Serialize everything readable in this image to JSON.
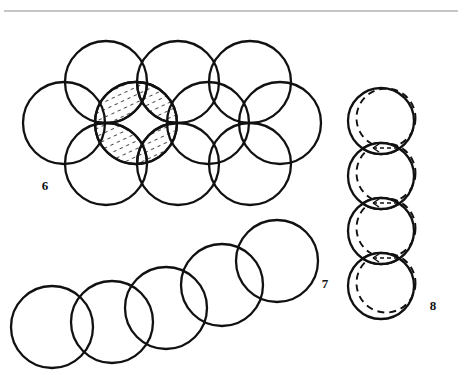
{
  "page": {
    "width": 462,
    "height": 385,
    "background": "#ffffff",
    "stroke_color": "#111111",
    "rule_color": "#8e8e8e",
    "hatch_color": "#4a4a4a"
  },
  "top_rule": {
    "name": "horizontal-rule",
    "x1": 4,
    "x2": 458,
    "y": 11,
    "thickness": 1
  },
  "figures": [
    {
      "id": "figure-6",
      "label": "6",
      "label_x": 45,
      "label_y": 190,
      "caption_position": "bottom-left",
      "description": "Hexagonal-packed cluster of nine equal circles in two offset rows; four lens-shaped intersection areas near the centre are hatched with short dashes",
      "circle_radius": 41,
      "circle_count": 9,
      "lens_count": 4,
      "circles": [
        {
          "cx": 106,
          "cy": 82
        },
        {
          "cx": 178,
          "cy": 82
        },
        {
          "cx": 250,
          "cy": 82
        },
        {
          "cx": 64,
          "cy": 123
        },
        {
          "cx": 136,
          "cy": 123
        },
        {
          "cx": 208,
          "cy": 123
        },
        {
          "cx": 280,
          "cy": 123
        },
        {
          "cx": 106,
          "cy": 164
        },
        {
          "cx": 178,
          "cy": 164
        },
        {
          "cx": 250,
          "cy": 164
        }
      ],
      "lenses": [
        {
          "a": 0,
          "b": 4,
          "note": "upper-left lens"
        },
        {
          "a": 1,
          "b": 4,
          "note": "upper-right lens"
        },
        {
          "a": 7,
          "b": 4,
          "note": "lower-left lens"
        },
        {
          "a": 8,
          "b": 4,
          "note": "lower-right lens"
        }
      ]
    },
    {
      "id": "figure-7",
      "label": "7",
      "label_x": 325,
      "label_y": 288,
      "caption_position": "right",
      "description": "Chain of five equal overlapping circles rising diagonally from lower-left to upper-right",
      "circle_radius": 41,
      "circle_count": 5,
      "circles": [
        {
          "cx": 52,
          "cy": 327
        },
        {
          "cx": 112,
          "cy": 322
        },
        {
          "cx": 166,
          "cy": 308
        },
        {
          "cx": 222,
          "cy": 285
        },
        {
          "cx": 277,
          "cy": 261
        }
      ]
    },
    {
      "id": "figure-8",
      "label": "8",
      "label_x": 433,
      "label_y": 310,
      "caption_position": "bottom-right",
      "description": "Vertical column of four circle pairs; each pair is a solid circle plus a dashed circle offset slightly, the narrow overlap lenses between successive pairs contain small double-headed arrows",
      "circle_radius": 33,
      "unit_count": 4,
      "dash_offset": {
        "dx": 5,
        "dy": -3
      },
      "units": [
        {
          "cx": 381,
          "cy": 121,
          "arrow_below": true
        },
        {
          "cx": 381,
          "cy": 176,
          "arrow_below": true
        },
        {
          "cx": 381,
          "cy": 231,
          "arrow_below": true
        },
        {
          "cx": 381,
          "cy": 286,
          "arrow_below": false
        }
      ],
      "arrows": [
        {
          "cx": 386,
          "cy": 148,
          "type": "double-headed-arrow"
        },
        {
          "cx": 386,
          "cy": 203,
          "type": "double-headed-arrow"
        },
        {
          "cx": 386,
          "cy": 258,
          "type": "double-headed-arrow"
        }
      ]
    }
  ]
}
